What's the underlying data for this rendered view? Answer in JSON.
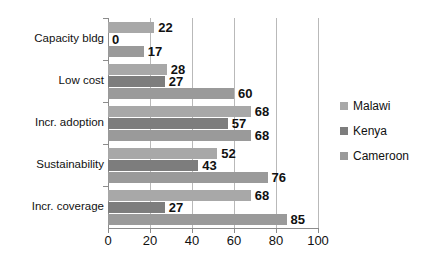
{
  "chart_data": {
    "type": "bar",
    "orientation": "horizontal",
    "title": "",
    "subtitle": "",
    "xlabel": "",
    "ylabel": "",
    "xlim": [
      0,
      100
    ],
    "xticks": [
      0,
      20,
      40,
      60,
      80,
      100
    ],
    "grid": "vertical",
    "legend_position": "right",
    "categories": [
      "Capacity bldg",
      "Low cost",
      "Incr. adoption",
      "Sustainability",
      "Incr. coverage"
    ],
    "series": [
      {
        "name": "Malawi",
        "color": "#a8a8a8",
        "values": [
          22,
          28,
          68,
          52,
          68
        ]
      },
      {
        "name": "Kenya",
        "color": "#7d7d7d",
        "values": [
          0,
          27,
          57,
          43,
          27
        ]
      },
      {
        "name": "Cameroon",
        "color": "#9a9a9a",
        "values": [
          17,
          60,
          68,
          76,
          85
        ]
      }
    ],
    "data_labels": [
      {
        "category": "Capacity bldg",
        "series": "Malawi",
        "text": "22"
      },
      {
        "category": "Capacity bldg",
        "series": "Kenya",
        "text": "0"
      },
      {
        "category": "Capacity bldg",
        "series": "Cameroon",
        "text": "17"
      },
      {
        "category": "Low cost",
        "series": "Malawi",
        "text": "28"
      },
      {
        "category": "Low cost",
        "series": "Kenya",
        "text": "27"
      },
      {
        "category": "Low cost",
        "series": "Cameroon",
        "text": "60"
      },
      {
        "category": "Incr. adoption",
        "series": "Malawi",
        "text": "68"
      },
      {
        "category": "Incr. adoption",
        "series": "Kenya",
        "text": "57"
      },
      {
        "category": "Incr. adoption",
        "series": "Cameroon",
        "text": "68"
      },
      {
        "category": "Sustainability",
        "series": "Malawi",
        "text": "52"
      },
      {
        "category": "Sustainability",
        "series": "Kenya",
        "text": "43"
      },
      {
        "category": "Sustainability",
        "series": "Cameroon",
        "text": "76"
      },
      {
        "category": "Incr. coverage",
        "series": "Malawi",
        "text": "68"
      },
      {
        "category": "Incr. coverage",
        "series": "Kenya",
        "text": "27"
      },
      {
        "category": "Incr. coverage",
        "series": "Cameroon",
        "text": "85"
      }
    ]
  },
  "axis": {
    "x_tick_labels": [
      "0",
      "20",
      "40",
      "60",
      "80",
      "100"
    ],
    "y_tick_labels": [
      "Capacity bldg",
      "Low cost",
      "Incr. adoption",
      "Sustainability",
      "Incr. coverage"
    ]
  },
  "legend": {
    "entries": [
      {
        "label": "Malawi",
        "color": "#a8a8a8"
      },
      {
        "label": "Kenya",
        "color": "#7d7d7d"
      },
      {
        "label": "Cameroon",
        "color": "#9a9a9a"
      }
    ]
  },
  "colors": {
    "malawi": "#a8a8a8",
    "kenya": "#7d7d7d",
    "cameroon": "#9a9a9a",
    "gridline": "#b9b9b9",
    "axis": "#8c8c8c",
    "text": "#111111",
    "background": "#ffffff"
  }
}
